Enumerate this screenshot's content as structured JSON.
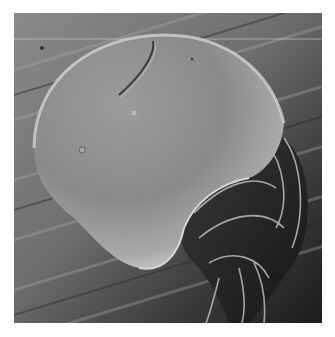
{
  "figure": {
    "kind": "scanning-electron-micrograph",
    "colors": {
      "page_background": "#ffffff",
      "substrate_light": "#9a9a9a",
      "substrate_dark": "#1e1e1e",
      "body_highlight": "#c4c4c4",
      "body_shadow": "#555555"
    }
  }
}
